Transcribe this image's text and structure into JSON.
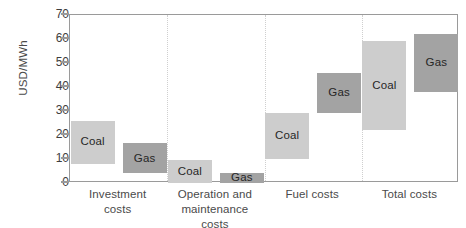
{
  "chart_data": {
    "type": "bar",
    "subtype": "floating-range-bar",
    "title": "",
    "xlabel": "",
    "ylabel": "USD/MWh",
    "ylim": [
      0,
      70
    ],
    "ytick_labels": [
      "0",
      "10",
      "20",
      "30",
      "40",
      "50",
      "60",
      "70"
    ],
    "ytick_values": [
      0,
      10,
      20,
      30,
      40,
      50,
      60,
      70
    ],
    "grid": false,
    "legend": "inline-bar-labels",
    "categories": [
      "Investment costs",
      "Operation and maintenance costs",
      "Fuel costs",
      "Total costs"
    ],
    "series": [
      {
        "name": "Coal",
        "color": "#cdcdcd",
        "ranges": [
          {
            "category": "Investment costs",
            "low": 8,
            "high": 26
          },
          {
            "category": "Operation and maintenance costs",
            "low": 0,
            "high": 9.5
          },
          {
            "category": "Fuel costs",
            "low": 10,
            "high": 29
          },
          {
            "category": "Total costs",
            "low": 22,
            "high": 59
          }
        ]
      },
      {
        "name": "Gas",
        "color": "#a3a3a3",
        "ranges": [
          {
            "category": "Investment costs",
            "low": 4,
            "high": 16.5
          },
          {
            "category": "Operation and maintenance costs",
            "low": 0,
            "high": 4
          },
          {
            "category": "Fuel costs",
            "low": 29,
            "high": 46
          },
          {
            "category": "Total costs",
            "low": 38,
            "high": 62
          }
        ]
      }
    ]
  },
  "axis": {
    "y_title": "USD/MWh"
  },
  "category_labels": [
    {
      "line1": "Investment",
      "line2": "costs"
    },
    {
      "line1": "Operation and",
      "line2": "maintenance costs"
    },
    {
      "line1": "Fuel costs",
      "line2": ""
    },
    {
      "line1": "Total costs",
      "line2": ""
    }
  ],
  "bar_labels": {
    "coal": "Coal",
    "gas": "Gas"
  }
}
